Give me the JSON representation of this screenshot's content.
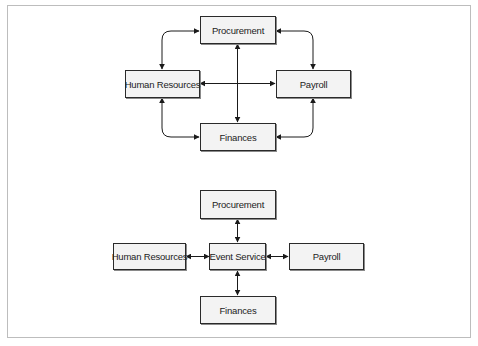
{
  "diagram": {
    "type": "integration-architecture-comparison",
    "colors": {
      "frame_border": "#bdbdbd",
      "node_fill": "#f3f3f3",
      "node_border": "#2a2a2a",
      "edge": "#1a1a1a"
    },
    "top": {
      "title": "Point-to-point integration",
      "nodes": [
        {
          "id": "procurement",
          "label": "Procurement"
        },
        {
          "id": "human_resources",
          "label": "Human Resources"
        },
        {
          "id": "payroll",
          "label": "Payroll"
        },
        {
          "id": "finances",
          "label": "Finances"
        }
      ],
      "edges": [
        {
          "from": "human_resources",
          "to": "procurement",
          "direction": "both"
        },
        {
          "from": "procurement",
          "to": "payroll",
          "direction": "both"
        },
        {
          "from": "human_resources",
          "to": "finances",
          "direction": "both"
        },
        {
          "from": "finances",
          "to": "payroll",
          "direction": "both"
        },
        {
          "from": "human_resources",
          "to": "payroll",
          "direction": "both"
        },
        {
          "from": "procurement",
          "to": "finances",
          "direction": "both"
        }
      ]
    },
    "bottom": {
      "title": "Hub integration via event service",
      "nodes": [
        {
          "id": "procurement",
          "label": "Procurement"
        },
        {
          "id": "human_resources",
          "label": "Human Resources"
        },
        {
          "id": "event_service",
          "label": "Event Service"
        },
        {
          "id": "payroll",
          "label": "Payroll"
        },
        {
          "id": "finances",
          "label": "Finances"
        }
      ],
      "edges": [
        {
          "from": "event_service",
          "to": "procurement",
          "direction": "both"
        },
        {
          "from": "event_service",
          "to": "human_resources",
          "direction": "both"
        },
        {
          "from": "event_service",
          "to": "payroll",
          "direction": "both"
        },
        {
          "from": "event_service",
          "to": "finances",
          "direction": "both"
        }
      ]
    }
  }
}
